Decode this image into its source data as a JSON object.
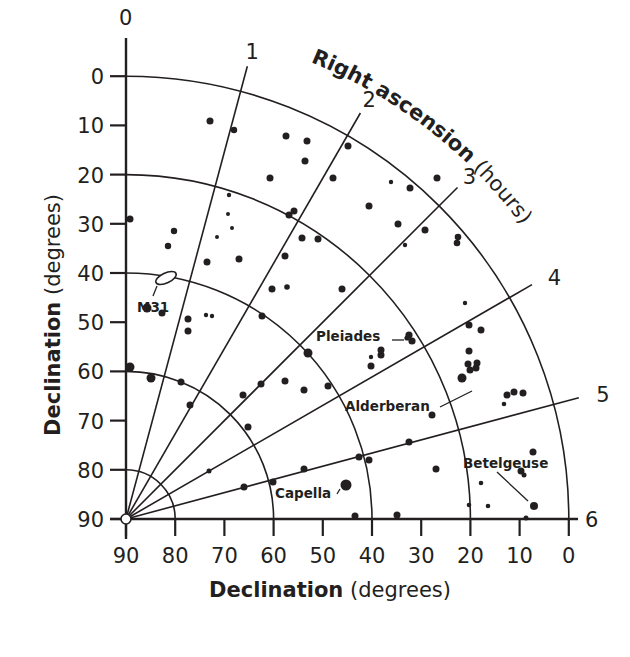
{
  "chart_data": {
    "type": "scatter",
    "title": "",
    "subtitle": "Polar star chart: one quadrant of the sky, Right ascension 0–6 hours",
    "xlabel": "Declination (degrees)",
    "ylabel": "Declination (degrees)",
    "arc_axis_label": {
      "bold": "Right ascension",
      "normal": "(hours)"
    },
    "x_axis": {
      "bold": "Declination",
      "normal": "(degrees)"
    },
    "y_axis": {
      "bold": "Declination",
      "normal": "(degrees)"
    },
    "declination_ticks": [
      90,
      80,
      70,
      60,
      50,
      40,
      30,
      20,
      10,
      0
    ],
    "declination_circles": [
      80,
      60,
      40,
      20,
      0
    ],
    "right_ascension_hours": [
      0,
      1,
      2,
      3,
      4,
      5,
      6
    ],
    "xlim": [
      90,
      0
    ],
    "ylim": [
      90,
      0
    ],
    "grid": true,
    "geometry": {
      "origin_x": 126,
      "origin_y": 519,
      "px_per_degree": 4.92,
      "deg_per_hour": 15
    },
    "labeled_objects": [
      {
        "name": "M31",
        "ra_hours": 0.7,
        "dec_deg": 41,
        "marker": "ellipse"
      },
      {
        "name": "Pleiades",
        "ra_hours": 3.8,
        "dec_deg": 24,
        "marker": "cluster"
      },
      {
        "name": "Alderberan",
        "ra_hours": 4.6,
        "dec_deg": 16.5,
        "marker": "star"
      },
      {
        "name": "Capella",
        "ra_hours": 5.3,
        "dec_deg": 46,
        "marker": "star"
      },
      {
        "name": "Betelgeuse",
        "ra_hours": 5.9,
        "dec_deg": 7.4,
        "marker": "star"
      },
      {
        "name": "Polaris (pole)",
        "ra_hours": 0,
        "dec_deg": 90,
        "marker": "open-circle"
      }
    ],
    "stars_px": [
      [
        210,
        121,
        3.5
      ],
      [
        234,
        130,
        3.2
      ],
      [
        286,
        136,
        3.5
      ],
      [
        307,
        141,
        3.5
      ],
      [
        305,
        161,
        3.5
      ],
      [
        270,
        178,
        3.5
      ],
      [
        130,
        219,
        3.5
      ],
      [
        174,
        231,
        3.2
      ],
      [
        168,
        246,
        3.2
      ],
      [
        207,
        262,
        3.5
      ],
      [
        239,
        259,
        3.5
      ],
      [
        229,
        195,
        2.2
      ],
      [
        228,
        214,
        2.0
      ],
      [
        232,
        228,
        2.0
      ],
      [
        217,
        237,
        2.0
      ],
      [
        294,
        211,
        3.5
      ],
      [
        289,
        215,
        3.5
      ],
      [
        302,
        238,
        3.5
      ],
      [
        285,
        256,
        3.5
      ],
      [
        272,
        289,
        3.5
      ],
      [
        287,
        287,
        2.8
      ],
      [
        262,
        316,
        3.5
      ],
      [
        316,
        42,
        0
      ],
      [
        348,
        146,
        3.5
      ],
      [
        333,
        178,
        3.5
      ],
      [
        369,
        206,
        3.5
      ],
      [
        410,
        188,
        3.5
      ],
      [
        437,
        178,
        3.5
      ],
      [
        398,
        224,
        3.5
      ],
      [
        425,
        230,
        3.5
      ],
      [
        405,
        245,
        2.2
      ],
      [
        391,
        182,
        2.2
      ],
      [
        458,
        237,
        3.3
      ],
      [
        457,
        243,
        3.3
      ],
      [
        465,
        303,
        2.2
      ],
      [
        469,
        325,
        3.5
      ],
      [
        342,
        289,
        3.5
      ],
      [
        308,
        353,
        4.5
      ],
      [
        318,
        239,
        3.5
      ],
      [
        188,
        319,
        3.5
      ],
      [
        188,
        331,
        3.5
      ],
      [
        206,
        315,
        2.2
      ],
      [
        212,
        316,
        2.2
      ],
      [
        162,
        313,
        3.5
      ],
      [
        147,
        308,
        4.5
      ],
      [
        130,
        367,
        4.5
      ],
      [
        151,
        378,
        4.5
      ],
      [
        181,
        382,
        3.5
      ],
      [
        190,
        405,
        3.5
      ],
      [
        243,
        395,
        3.5
      ],
      [
        261,
        384,
        3.5
      ],
      [
        285,
        381,
        3.5
      ],
      [
        304,
        390,
        3.5
      ],
      [
        328,
        386,
        3.5
      ],
      [
        248,
        427,
        3.5
      ],
      [
        209,
        471,
        2.5
      ],
      [
        244,
        487,
        3.5
      ],
      [
        273,
        482,
        3.5
      ],
      [
        304,
        469,
        3.5
      ],
      [
        359,
        457,
        3.5
      ],
      [
        369,
        460,
        3.5
      ],
      [
        409,
        442,
        3.5
      ],
      [
        432,
        415,
        3.5
      ],
      [
        346,
        485,
        5.5
      ],
      [
        355,
        516,
        3.5
      ],
      [
        397,
        515,
        3.5
      ],
      [
        436,
        469,
        3.5
      ],
      [
        371,
        366,
        3.5
      ],
      [
        381,
        355,
        3.5
      ],
      [
        371,
        357,
        2.2
      ],
      [
        381,
        350,
        3.5
      ],
      [
        481,
        330,
        3.5
      ],
      [
        469,
        351,
        3.5
      ],
      [
        476,
        368,
        3.5
      ],
      [
        462,
        378,
        4.5
      ],
      [
        470,
        370,
        3.5
      ],
      [
        468,
        364,
        3.5
      ],
      [
        477,
        363,
        3.5
      ],
      [
        507,
        395,
        3.5
      ],
      [
        514,
        392,
        3.5
      ],
      [
        523,
        393,
        3.5
      ],
      [
        504,
        404,
        2.3
      ],
      [
        533,
        452,
        3.5
      ],
      [
        521,
        471,
        3.5
      ],
      [
        524,
        475,
        2.5
      ],
      [
        481,
        483,
        2.3
      ],
      [
        469,
        505,
        2.3
      ],
      [
        534,
        506,
        4.0
      ],
      [
        526,
        518,
        2.5
      ],
      [
        488,
        506,
        2.3
      ]
    ],
    "cluster_pleiades_px": [
      [
        410,
        335,
        3.5
      ],
      [
        412,
        340,
        3.5
      ],
      [
        409,
        337,
        3.0
      ],
      [
        414,
        343,
        3.5
      ]
    ]
  },
  "labels": {
    "m31": "M31",
    "pleiades": "Pleiades",
    "alderberan": "Alderberan",
    "capella": "Capella",
    "betelgeuse": "Betelgeuse"
  }
}
